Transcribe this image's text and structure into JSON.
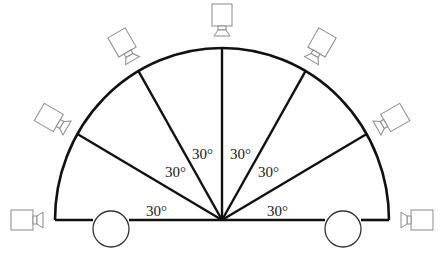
{
  "diagram": {
    "type": "semicircle camera layout",
    "stroke_color": "#111111",
    "camera_color": "#8a8a8a",
    "center": [
      222,
      220
    ],
    "radius_x": 167,
    "radius_y": 172,
    "divisions": 6,
    "angle_step_deg": 30,
    "angle_labels": [
      {
        "text": "30°",
        "x": 146,
        "y": 204
      },
      {
        "text": "30°",
        "x": 165,
        "y": 165
      },
      {
        "text": "30°",
        "x": 192,
        "y": 147
      },
      {
        "text": "30°",
        "x": 230,
        "y": 147
      },
      {
        "text": "30°",
        "x": 258,
        "y": 165
      },
      {
        "text": "30°",
        "x": 267,
        "y": 204
      }
    ],
    "wheels": [
      {
        "cx": 111,
        "cy": 229,
        "r": 18
      },
      {
        "cx": 343,
        "cy": 229,
        "r": 18
      }
    ],
    "cameras": [
      {
        "angle_deg": 180,
        "label": "camera-0"
      },
      {
        "angle_deg": 150,
        "label": "camera-30"
      },
      {
        "angle_deg": 120,
        "label": "camera-60"
      },
      {
        "angle_deg": 90,
        "label": "camera-90"
      },
      {
        "angle_deg": 60,
        "label": "camera-120"
      },
      {
        "angle_deg": 30,
        "label": "camera-150"
      },
      {
        "angle_deg": 0,
        "label": "camera-180"
      }
    ]
  }
}
